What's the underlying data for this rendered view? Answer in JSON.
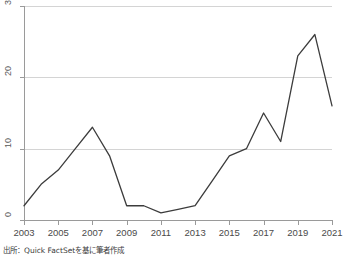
{
  "chart_data": {
    "type": "line",
    "title": "",
    "subtitle": "",
    "xlabel": "",
    "ylabel": "",
    "xlim": [
      2003,
      2021
    ],
    "ylim": [
      0,
      30
    ],
    "grid": true,
    "legend": null,
    "x": [
      2003,
      2004,
      2005,
      2006,
      2007,
      2008,
      2009,
      2010,
      2011,
      2012,
      2013,
      2014,
      2015,
      2016,
      2017,
      2018,
      2019,
      2020,
      2021
    ],
    "series": [
      {
        "name": "",
        "color": "#3c3c3c",
        "values": [
          2,
          5,
          7,
          10,
          13,
          9,
          2,
          2,
          1,
          1.5,
          2,
          5.5,
          9,
          10,
          15,
          11,
          23,
          26,
          16
        ]
      }
    ],
    "x_tick_labels": [
      "2003",
      "2005",
      "2007",
      "2009",
      "2011",
      "2013",
      "2015",
      "2017",
      "2019",
      "2021"
    ],
    "x_tick_values": [
      2003,
      2005,
      2007,
      2009,
      2011,
      2013,
      2015,
      2017,
      2019,
      2021
    ],
    "y_tick_labels": [
      "0",
      "10",
      "20",
      "30"
    ],
    "y_tick_values": [
      0,
      10,
      20,
      30
    ],
    "annotations": []
  },
  "figure": {
    "source_note": "出所：Quick FactSetを基に筆者作成",
    "axis_color": "#9a9a9a",
    "gridline_color": "#d4d4d4",
    "tick_label_color": "#4a4a4a",
    "background": "#ffffff"
  }
}
